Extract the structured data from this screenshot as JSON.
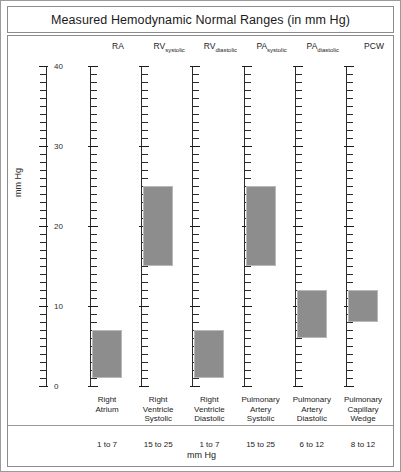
{
  "chart_data": {
    "type": "bar",
    "title": "Measured Hemodynamic Normal Ranges (in mm Hg)",
    "xlabel": "mm Hg",
    "ylabel": "mm Hg",
    "ylim": [
      0,
      40
    ],
    "ytick_labels": [
      "0",
      "10",
      "20",
      "30",
      "40"
    ],
    "ytick_values": [
      0,
      10,
      20,
      30,
      40
    ],
    "minor_tick_step": 1,
    "grid": false,
    "legend": "none",
    "orientation": "vertical-range-bars",
    "bar_color": "#8d8d8d",
    "axis_color": "#2b2b2b",
    "categories": [
      {
        "key": "RA",
        "header_main": "RA",
        "header_sub": "",
        "name_lines": [
          "Right",
          "Atrium"
        ],
        "low": 1,
        "high": 7,
        "range_text": "1 to 7"
      },
      {
        "key": "RVsystolic",
        "header_main": "RV",
        "header_sub": "systolic",
        "name_lines": [
          "Right",
          "Ventricle",
          "Systolic"
        ],
        "low": 15,
        "high": 25,
        "range_text": "15 to 25"
      },
      {
        "key": "RVdiastolic",
        "header_main": "RV",
        "header_sub": "diastolic",
        "name_lines": [
          "Right",
          "Ventricle",
          "Diastolic"
        ],
        "low": 1,
        "high": 7,
        "range_text": "1 to 7"
      },
      {
        "key": "PAsystolic",
        "header_main": "PA",
        "header_sub": "systolic",
        "name_lines": [
          "Pulmonary",
          "Artery",
          "Systolic"
        ],
        "low": 15,
        "high": 25,
        "range_text": "15 to 25"
      },
      {
        "key": "PAdiastolic",
        "header_main": "PA",
        "header_sub": "diastolic",
        "name_lines": [
          "Pulmonary",
          "Artery",
          "Diastolic"
        ],
        "low": 6,
        "high": 12,
        "range_text": "6 to 12"
      },
      {
        "key": "PCW",
        "header_main": "PCW",
        "header_sub": "",
        "name_lines": [
          "Pulmonary",
          "Capillary",
          "Wedge"
        ],
        "low": 8,
        "high": 12,
        "range_text": "8 to 12"
      }
    ]
  }
}
